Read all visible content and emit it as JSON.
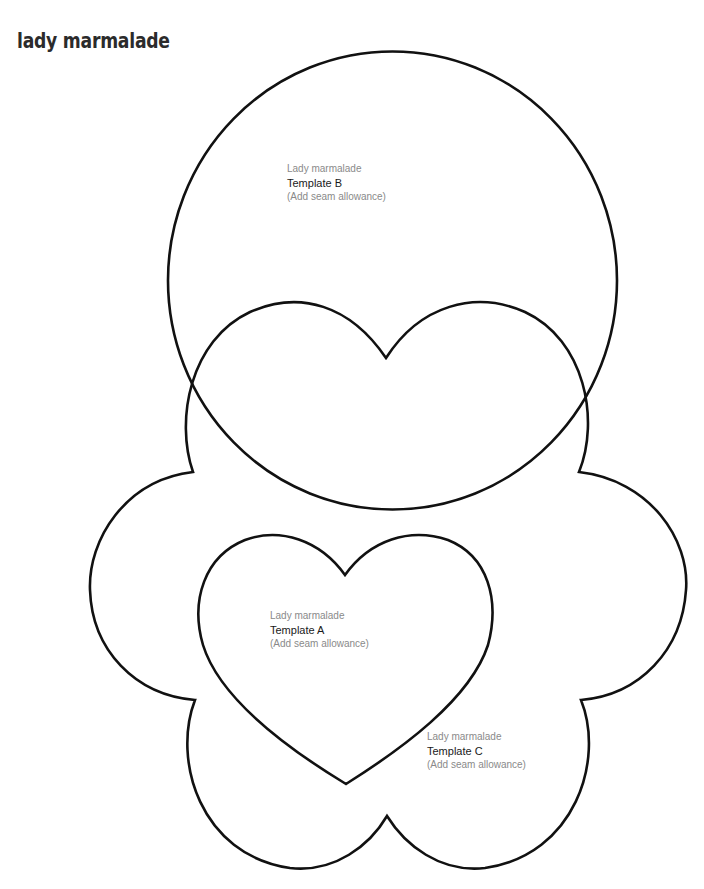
{
  "page": {
    "title": "lady marmalade"
  },
  "templates": {
    "b": {
      "line1": "Lady marmalade",
      "line2": "Template B",
      "line3": "(Add seam allowance)"
    },
    "a": {
      "line1": "Lady marmalade",
      "line2": "Template A",
      "line3": "(Add seam allowance)"
    },
    "c": {
      "line1": "Lady marmalade",
      "line2": "Template C",
      "line3": "(Add seam allowance)"
    }
  },
  "colors": {
    "outline": "#111111",
    "title": "#2b2b2b",
    "label_light": "#8a8a8a",
    "label_dark": "#1a1a1a"
  }
}
